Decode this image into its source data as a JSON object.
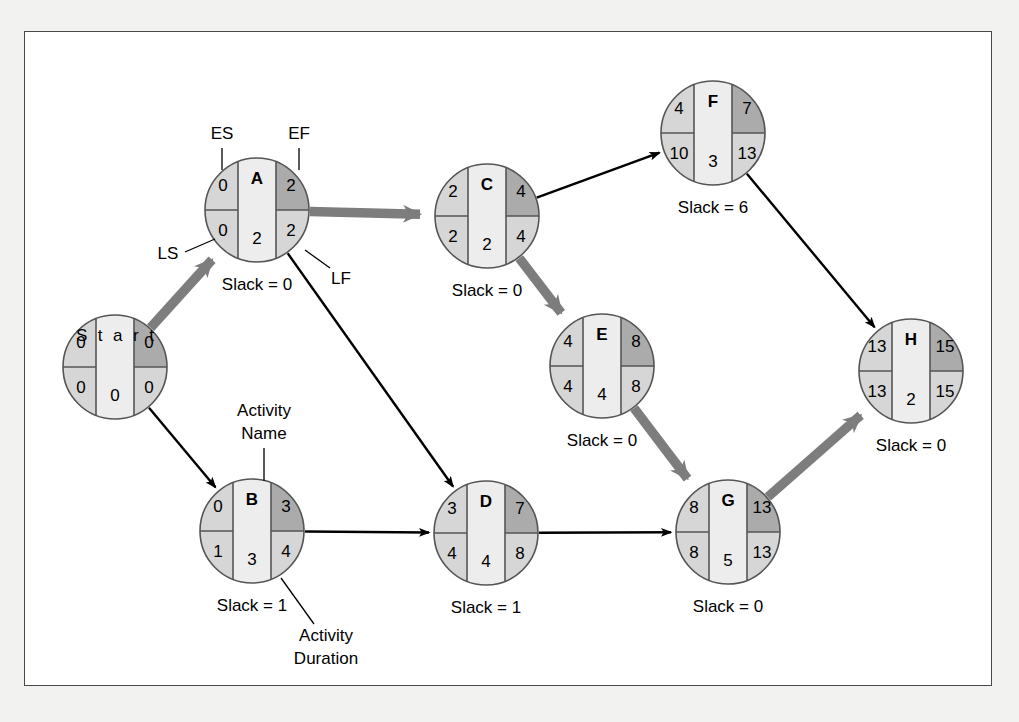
{
  "diagram": {
    "type": "project-network-cpm",
    "title": "",
    "colors": {
      "page_background": "#f2f2f0",
      "frame_background": "#ffffff",
      "frame_border": "#4a4a4a",
      "node_outline": "#555555",
      "cell_light": "#d6d6d6",
      "cell_dark": "#ababab",
      "cell_center": "#ededed",
      "critical_arrow": "#7d7d7d",
      "normal_arrow": "#000000",
      "text": "#000000"
    },
    "legend_annotations": [
      {
        "id": "es",
        "label": "ES",
        "meaning": "early-start",
        "x": 222,
        "y": 135
      },
      {
        "id": "ef",
        "label": "EF",
        "meaning": "early-finish",
        "x": 299,
        "y": 135
      },
      {
        "id": "ls",
        "label": "LS",
        "meaning": "late-start",
        "x": 168,
        "y": 255
      },
      {
        "id": "lf",
        "label": "LF",
        "meaning": "late-finish",
        "x": 341,
        "y": 280
      },
      {
        "id": "activity-name-1",
        "label": "Activity",
        "meaning": "activity-name",
        "x": 264,
        "y": 412
      },
      {
        "id": "activity-name-2",
        "label": "Name",
        "meaning": "activity-name",
        "x": 264,
        "y": 435
      },
      {
        "id": "activity-duration-1",
        "label": "Activity",
        "meaning": "activity-duration",
        "x": 326,
        "y": 637
      },
      {
        "id": "activity-duration-2",
        "label": "Duration",
        "meaning": "activity-duration",
        "x": 326,
        "y": 660
      }
    ],
    "nodes": [
      {
        "id": "start",
        "name": "Start",
        "es": "0",
        "ef": "0",
        "ls": "0",
        "lf": "0",
        "duration": "0",
        "slack": null,
        "slack_label": null,
        "cx": 115,
        "cy": 367,
        "r": 52,
        "is_start": true
      },
      {
        "id": "a",
        "name": "A",
        "es": "0",
        "ef": "2",
        "ls": "0",
        "lf": "2",
        "duration": "2",
        "slack": "0",
        "slack_label": "Slack = 0",
        "cx": 257,
        "cy": 210,
        "r": 52,
        "is_start": false
      },
      {
        "id": "b",
        "name": "B",
        "es": "0",
        "ef": "3",
        "ls": "1",
        "lf": "4",
        "duration": "3",
        "slack": "1",
        "slack_label": "Slack = 1",
        "cx": 252,
        "cy": 531,
        "r": 52,
        "is_start": false
      },
      {
        "id": "c",
        "name": "C",
        "es": "2",
        "ef": "4",
        "ls": "2",
        "lf": "4",
        "duration": "2",
        "slack": "0",
        "slack_label": "Slack = 0",
        "cx": 487,
        "cy": 216,
        "r": 52,
        "is_start": false
      },
      {
        "id": "d",
        "name": "D",
        "es": "3",
        "ef": "7",
        "ls": "4",
        "lf": "8",
        "duration": "4",
        "slack": "1",
        "slack_label": "Slack = 1",
        "cx": 486,
        "cy": 533,
        "r": 52,
        "is_start": false
      },
      {
        "id": "e",
        "name": "E",
        "es": "4",
        "ef": "8",
        "ls": "4",
        "lf": "8",
        "duration": "4",
        "slack": "0",
        "slack_label": "Slack = 0",
        "cx": 602,
        "cy": 366,
        "r": 52,
        "is_start": false
      },
      {
        "id": "f",
        "name": "F",
        "es": "4",
        "ef": "7",
        "ls": "10",
        "lf": "13",
        "duration": "3",
        "slack": "6",
        "slack_label": "Slack = 6",
        "cx": 713,
        "cy": 133,
        "r": 52,
        "is_start": false
      },
      {
        "id": "g",
        "name": "G",
        "es": "8",
        "ef": "13",
        "ls": "8",
        "lf": "13",
        "duration": "5",
        "slack": "0",
        "slack_label": "Slack = 0",
        "cx": 728,
        "cy": 532,
        "r": 52,
        "is_start": false
      },
      {
        "id": "h",
        "name": "H",
        "es": "13",
        "ef": "15",
        "ls": "13",
        "lf": "15",
        "duration": "2",
        "slack": "0",
        "slack_label": "Slack = 0",
        "cx": 911,
        "cy": 371,
        "r": 52,
        "is_start": false
      }
    ],
    "edges": [
      {
        "id": "start-a",
        "from": "start",
        "to": "a",
        "critical": true
      },
      {
        "id": "start-b",
        "from": "start",
        "to": "b",
        "critical": false
      },
      {
        "id": "a-c",
        "from": "a",
        "to": "c",
        "critical": true
      },
      {
        "id": "a-d",
        "from": "a",
        "to": "d",
        "critical": false
      },
      {
        "id": "b-d",
        "from": "b",
        "to": "d",
        "critical": false
      },
      {
        "id": "c-f",
        "from": "c",
        "to": "f",
        "critical": false
      },
      {
        "id": "c-e",
        "from": "c",
        "to": "e",
        "critical": true
      },
      {
        "id": "d-g",
        "from": "d",
        "to": "g",
        "critical": false
      },
      {
        "id": "e-g",
        "from": "e",
        "to": "g",
        "critical": true
      },
      {
        "id": "f-h",
        "from": "f",
        "to": "h",
        "critical": false
      },
      {
        "id": "g-h",
        "from": "g",
        "to": "h",
        "critical": true
      }
    ]
  }
}
